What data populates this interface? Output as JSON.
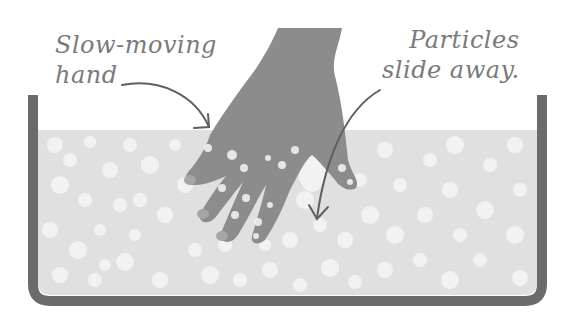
{
  "diagram": {
    "labels": {
      "hand": {
        "line1": "Slow-moving",
        "line2": "hand"
      },
      "particles": {
        "line1": "Particles",
        "line2": "slide away."
      }
    },
    "colors": {
      "container_wall": "#6b6b6b",
      "fill_base": "#e0e0e0",
      "particle_blob": "#f3f3f3",
      "hand": "#8c8c8c",
      "fingernail": "#a6a6a6",
      "arrow": "#5f5f5f",
      "text": "#7a7a7a"
    }
  }
}
